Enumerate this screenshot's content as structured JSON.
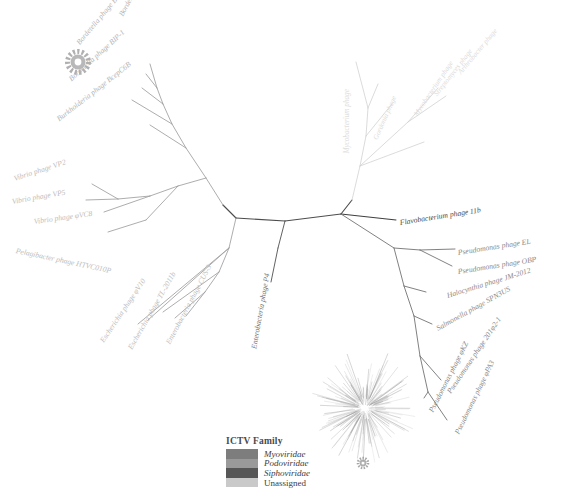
{
  "figure": {
    "type": "phylogenetic-tree",
    "layout": "unrooted-radial"
  },
  "legend": {
    "title": "ICTV Family",
    "entries": [
      {
        "label": "Myoviridae",
        "color": "#7d7d7d",
        "italic": true
      },
      {
        "label": "Podoviridae",
        "color": "#9a9a9a",
        "italic": true
      },
      {
        "label": "Siphoviridae",
        "color": "#565656",
        "italic": true
      },
      {
        "label": "Unassigned",
        "color": "#c9c9c9",
        "italic": false
      }
    ]
  },
  "taxa": [
    {
      "name": "Bordetella phage BMP-1",
      "x": 121,
      "y": 12,
      "rot": -62,
      "color": "#b4b4b4",
      "size": 7.6,
      "anchor": "start"
    },
    {
      "name": "Bordetella phage BPP-1",
      "x": 78,
      "y": 40,
      "rot": -50,
      "color": "#b4b4b4",
      "size": 7.6,
      "anchor": "start"
    },
    {
      "name": "Bordetella phage BIP-1",
      "x": 70,
      "y": 76,
      "rot": -42,
      "color": "#b4b4b4",
      "size": 7.6,
      "anchor": "start"
    },
    {
      "name": "Burkholderia phage BcepC6B",
      "x": 58,
      "y": 116,
      "rot": -38,
      "color": "#b4b4b4",
      "size": 7.6,
      "anchor": "start"
    },
    {
      "name": "Vibrio phage VP2",
      "x": 14,
      "y": 175,
      "rot": -18,
      "color": "#bdbdbd",
      "size": 7.6,
      "anchor": "start"
    },
    {
      "name": "Vibrio phage VP5",
      "x": 12,
      "y": 198,
      "rot": -10,
      "color": "#bdbdbd",
      "size": 7.6,
      "anchor": "start"
    },
    {
      "name": "Vibrio phage φVC8",
      "x": 34,
      "y": 218,
      "rot": -8,
      "color": "#bdbdbd",
      "size": 7.6,
      "anchor": "start"
    },
    {
      "name": "Pelagibacter phage HTVC010P",
      "x": 16,
      "y": 247,
      "rot": 12,
      "color": "#bdbdbd",
      "size": 7.6,
      "anchor": "start"
    },
    {
      "name": "Escherichia phage φV10",
      "x": 102,
      "y": 338,
      "rot": -56,
      "color": "#bdbdbd",
      "size": 7.6,
      "anchor": "start"
    },
    {
      "name": "Escherichia phage TL-2011b",
      "x": 130,
      "y": 345,
      "rot": -60,
      "color": "#bdbdbd",
      "size": 7.6,
      "anchor": "start"
    },
    {
      "name": "Enterobacteria phage CUS-3",
      "x": 168,
      "y": 340,
      "rot": -62,
      "color": "#bdbdbd",
      "size": 7.6,
      "anchor": "start"
    },
    {
      "name": "Enterobacteria phage P4",
      "x": 254,
      "y": 345,
      "rot": -80,
      "color": "#6e6e6e",
      "size": 7.6,
      "anchor": "start"
    },
    {
      "name": "Flavobacterium phage 11b",
      "x": 400,
      "y": 219,
      "rot": -9,
      "color": "#4a4a4a",
      "size": 7.6,
      "anchor": "start"
    },
    {
      "name": "Pseudomonas phage EL",
      "x": 458,
      "y": 249,
      "rot": -9,
      "color": "#8a8a8a",
      "size": 7.6,
      "anchor": "start"
    },
    {
      "name": "Pseudomonas phage OBP",
      "x": 458,
      "y": 268,
      "rot": -9,
      "color": "#8a8a8a",
      "size": 7.6,
      "anchor": "start"
    },
    {
      "name": "Halocynthia phage JM-2012",
      "x": 447,
      "y": 292,
      "rot": -17,
      "color": "#8a8a8a",
      "size": 7.6,
      "anchor": "start"
    },
    {
      "name": "Salmonella phage SPN3US",
      "x": 437,
      "y": 325,
      "rot": -29,
      "color": "#8a8a8a",
      "size": 7.6,
      "anchor": "start"
    },
    {
      "name": "Pseudomonas phage 201φ2-1",
      "x": 449,
      "y": 389,
      "rot": -56,
      "color": "#8a8a8a",
      "size": 7.6,
      "anchor": "start"
    },
    {
      "name": "Pseudomonas phage φKZ",
      "x": 431,
      "y": 408,
      "rot": -63,
      "color": "#8a8a8a",
      "size": 7.6,
      "anchor": "start"
    },
    {
      "name": "Pseudomonas phage φPA3",
      "x": 457,
      "y": 430,
      "rot": -64,
      "color": "#8a8a8a",
      "size": 7.6,
      "anchor": "start"
    },
    {
      "name": "Mycobacterium phage",
      "x": 348,
      "y": 150,
      "rot": -90,
      "color": "#dcdcdc",
      "size": 7.2,
      "anchor": "start"
    },
    {
      "name": "Gordonia phage",
      "x": 376,
      "y": 136,
      "rot": -66,
      "color": "#dcdcdc",
      "size": 7.2,
      "anchor": "start"
    },
    {
      "name": "Mycobacterium phage",
      "x": 416,
      "y": 112,
      "rot": -56,
      "color": "#dcdcdc",
      "size": 7.2,
      "anchor": "start"
    },
    {
      "name": "Streptomyces phage",
      "x": 436,
      "y": 92,
      "rot": -52,
      "color": "#dcdcdc",
      "size": 7.2,
      "anchor": "start"
    },
    {
      "name": "Arthrobacter phage",
      "x": 460,
      "y": 70,
      "rot": -50,
      "color": "#dcdcdc",
      "size": 7.2,
      "anchor": "start"
    }
  ],
  "markers": [
    {
      "name": "gear-marker-upper-left",
      "x": 78,
      "y": 62,
      "r": 12,
      "color": "#b0b0b0"
    },
    {
      "name": "gear-marker-inset",
      "x": 363,
      "y": 463,
      "r": 6,
      "color": "#a8a8a8"
    }
  ],
  "inset": {
    "name": "inset-radial-tree",
    "cx": 365,
    "cy": 408,
    "description": "Small overview radial tree"
  }
}
